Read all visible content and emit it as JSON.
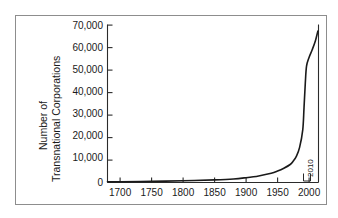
{
  "chart_data": {
    "type": "line",
    "title": "",
    "subtitle": "",
    "xlabel": "",
    "ylabel": "Number of Transnational Corporations",
    "ylabel_lines": [
      "Number of",
      "Transnational Corporations"
    ],
    "xlim": [
      1680,
      2015
    ],
    "ylim": [
      0,
      72000
    ],
    "grid": false,
    "legend": false,
    "legend_position": "none",
    "x_ticks": [
      1700,
      1750,
      1800,
      1850,
      1900,
      1950,
      2000
    ],
    "x_tick_labels": [
      "1700",
      "1750",
      "1800",
      "1850",
      "1900",
      "1950",
      "2000"
    ],
    "y_ticks": [
      0,
      10000,
      20000,
      30000,
      40000,
      50000,
      60000,
      70000
    ],
    "y_tick_labels": [
      "0",
      "10,000",
      "20,000",
      "30,000",
      "40,000",
      "50,000",
      "60,000",
      "70,000"
    ],
    "annotations": [
      {
        "text": "2010",
        "x": 2010,
        "y": 7000,
        "rotation": -90
      }
    ],
    "series": [
      {
        "name": "Number of Transnational Corporations",
        "color": "#1a1a1a",
        "x": [
          1680,
          1700,
          1750,
          1800,
          1850,
          1880,
          1900,
          1920,
          1940,
          1950,
          1960,
          1970,
          1975,
          1980,
          1985,
          1990,
          1992,
          1994,
          1996,
          2000,
          2005,
          2010,
          2014
        ],
        "values": [
          300,
          350,
          500,
          800,
          1200,
          1600,
          2200,
          3000,
          4200,
          5200,
          6500,
          8200,
          9800,
          12000,
          16000,
          24000,
          34000,
          45000,
          53000,
          57000,
          60500,
          64500,
          69000
        ]
      }
    ]
  },
  "axis": {
    "y_label_line1": "Number of",
    "y_label_line2": "Transnational Corporations"
  },
  "colors": {
    "line": "#1a1a1a",
    "axis": "#2b2b2b",
    "frame": "#8d8d8d",
    "background": "#ffffff"
  }
}
